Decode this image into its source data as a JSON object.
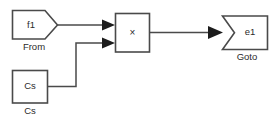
{
  "diagram": {
    "type": "block-diagram",
    "width": 274,
    "height": 126,
    "background": "#ffffff",
    "line_color": "#4a4a4a",
    "text_color": "#2b2b2b",
    "arrow_color": "#1c1c1c",
    "blocks": [
      {
        "id": "from",
        "shape": "pentagon-right",
        "label": "f1",
        "caption": "From"
      },
      {
        "id": "product",
        "shape": "rectangle",
        "label": "×",
        "caption": ""
      },
      {
        "id": "goto",
        "shape": "pentagon-left-notch",
        "label": "e1",
        "caption": "Goto"
      },
      {
        "id": "constant",
        "shape": "rectangle",
        "label": "Cs",
        "caption": "Cs"
      }
    ],
    "connections": [
      {
        "from": "from",
        "to": "product",
        "port": 1
      },
      {
        "from": "constant",
        "to": "product",
        "port": 2
      },
      {
        "from": "product",
        "to": "goto",
        "port": 1
      }
    ]
  }
}
